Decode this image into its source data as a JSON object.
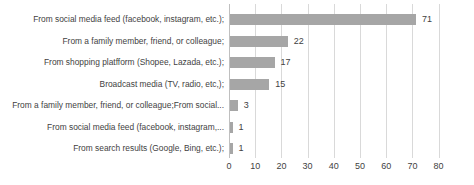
{
  "chart_data": {
    "type": "bar",
    "orientation": "horizontal",
    "title": "",
    "xlabel": "",
    "ylabel": "",
    "categories": [
      "From social media feed (facebook, instagram, etc.);",
      "From a family member, friend, or colleague;",
      "From shopping platfform (Shopee, Lazada, etc.);",
      "Broadcast media (TV, radio, etc,);",
      "From a family member, friend, or colleague;From social...",
      "From social media feed (facebook, instagram,...",
      "From search results (Google, Bing, etc.);"
    ],
    "values": [
      71,
      22,
      17,
      15,
      3,
      1,
      1
    ],
    "data_labels": [
      71,
      22,
      17,
      15,
      3,
      1,
      1
    ],
    "xlim": [
      0,
      80
    ],
    "x_ticks": [
      0,
      10,
      20,
      30,
      40,
      50,
      60,
      70,
      80
    ],
    "grid": true,
    "legend": "none",
    "bar_color": "#a6a6a6",
    "gridline_color": "#d9d9d9",
    "axisline_color": "#bfbfbf",
    "text_color": "#3f3f3f"
  }
}
